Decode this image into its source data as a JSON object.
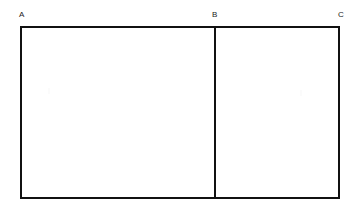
{
  "figure": {
    "kind": "geometry-diagram",
    "background_color": "#ffffff",
    "stroke_color": "#111111",
    "stroke_width_px": 2,
    "labels": {
      "a": "A",
      "b": "B",
      "c": "C"
    },
    "label_color": "#1a1a1a",
    "outer_rectangle": {
      "x": 20,
      "y": 26,
      "width": 320,
      "height": 173
    },
    "divider": {
      "x": 214,
      "y": 26,
      "width": 2,
      "height": 173,
      "orientation": "vertical",
      "at_label": "B"
    },
    "regions": [
      {
        "name": "left-region",
        "from": "A",
        "to": "B",
        "width": 194
      },
      {
        "name": "right-region",
        "from": "B",
        "to": "C",
        "width": 124
      }
    ]
  }
}
